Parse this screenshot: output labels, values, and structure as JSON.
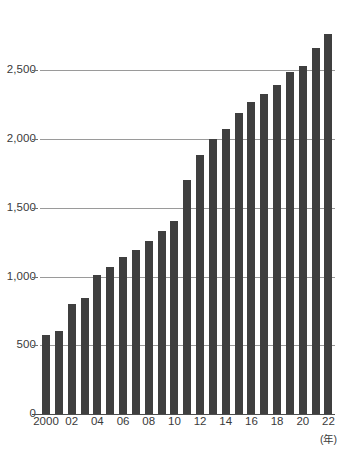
{
  "chart_data": {
    "type": "bar",
    "title": "",
    "subtitle": "",
    "xlabel": "(年)",
    "ylabel": "",
    "categories": [
      "2000",
      "2001",
      "2002",
      "2003",
      "2004",
      "2005",
      "2006",
      "2007",
      "2008",
      "2009",
      "2010",
      "2011",
      "2012",
      "2013",
      "2014",
      "2015",
      "2016",
      "2017",
      "2018",
      "2019",
      "2020",
      "2021",
      "2022"
    ],
    "values": [
      575,
      605,
      800,
      845,
      1010,
      1070,
      1140,
      1190,
      1255,
      1330,
      1405,
      1700,
      1885,
      2000,
      2070,
      2190,
      2270,
      2330,
      2390,
      2490,
      2530,
      2660,
      2765
    ],
    "x_tick_labels": [
      "2000",
      "02",
      "04",
      "06",
      "08",
      "10",
      "12",
      "14",
      "16",
      "18",
      "20",
      "22"
    ],
    "x_tick_indices": [
      0,
      2,
      4,
      6,
      8,
      10,
      12,
      14,
      16,
      18,
      20,
      22
    ],
    "y_tick_labels": [
      "0",
      "500",
      "1,000",
      "1,500",
      "2,000",
      "2,500"
    ],
    "y_ticks": [
      0,
      500,
      1000,
      1500,
      2000,
      2500
    ],
    "ylim": [
      0,
      2880
    ],
    "grid": "horizontal",
    "legend": "none",
    "bar_color": "#3f3f3f",
    "grid_color": "#9a9a9a",
    "axis_color": "#4d4d4d",
    "background_color": "#ffffff"
  }
}
